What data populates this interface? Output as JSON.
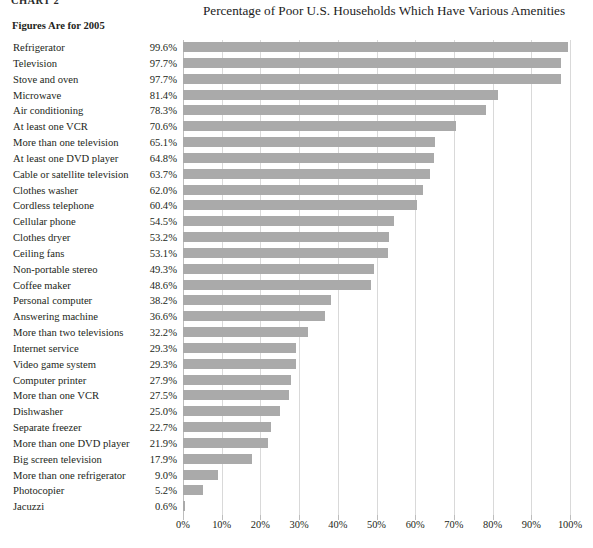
{
  "chart_number": "CHART 2",
  "figures_note": "Figures Are for 2005",
  "chart_data": {
    "type": "bar",
    "orientation": "horizontal",
    "title": "Percentage of Poor U.S. Households Which Have Various Amenities",
    "subtitle": "Figures Are for 2005",
    "xlabel": "",
    "ylabel": "",
    "xlim": [
      0,
      100
    ],
    "xticks": [
      0,
      10,
      20,
      30,
      40,
      50,
      60,
      70,
      80,
      90,
      100
    ],
    "xtick_labels": [
      "0%",
      "10%",
      "20%",
      "30%",
      "40%",
      "50%",
      "60%",
      "70%",
      "80%",
      "90%",
      "100%"
    ],
    "grid": true,
    "legend": "none",
    "bar_color": "#aaaaaa",
    "value_label_format": "0.0%",
    "categories": [
      "Refrigerator",
      "Television",
      "Stove and oven",
      "Microwave",
      "Air conditioning",
      "At least one VCR",
      "More than one television",
      "At least one DVD player",
      "Cable or satellite television",
      "Clothes washer",
      "Cordless telephone",
      "Cellular phone",
      "Clothes dryer",
      "Ceiling fans",
      "Non-portable stereo",
      "Coffee maker",
      "Personal computer",
      "Answering machine",
      "More than two televisions",
      "Internet service",
      "Video game system",
      "Computer printer",
      "More than one VCR",
      "Dishwasher",
      "Separate freezer",
      "More than one DVD player",
      "Big screen television",
      "More than one refrigerator",
      "Photocopier",
      "Jacuzzi"
    ],
    "values": [
      99.6,
      97.7,
      97.7,
      81.4,
      78.3,
      70.6,
      65.1,
      64.8,
      63.7,
      62.0,
      60.4,
      54.5,
      53.2,
      53.1,
      49.3,
      48.6,
      38.2,
      36.6,
      32.2,
      29.3,
      29.3,
      27.9,
      27.5,
      25.0,
      22.7,
      21.9,
      17.9,
      9.0,
      5.2,
      0.6
    ],
    "value_labels": [
      "99.6%",
      "97.7%",
      "97.7%",
      "81.4%",
      "78.3%",
      "70.6%",
      "65.1%",
      "64.8%",
      "63.7%",
      "62.0%",
      "60.4%",
      "54.5%",
      "53.2%",
      "53.1%",
      "49.3%",
      "48.6%",
      "38.2%",
      "36.6%",
      "32.2%",
      "29.3%",
      "29.3%",
      "27.9%",
      "27.5%",
      "25.0%",
      "22.7%",
      "21.9%",
      "17.9%",
      "9.0%",
      "5.2%",
      "0.6%"
    ]
  }
}
